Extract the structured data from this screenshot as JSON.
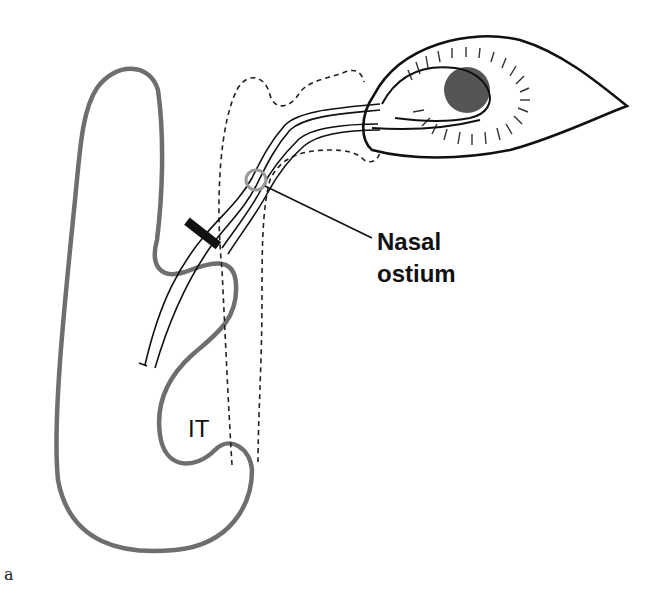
{
  "figure": {
    "panel_label": "a",
    "labels": {
      "nasal_ostium_line1": "Nasal",
      "nasal_ostium_line2": "ostium",
      "inferior_turbinate": "IT"
    }
  },
  "colors": {
    "nasal_wall": "#6e6e6e",
    "outline": "#111111",
    "pupil": "#555555",
    "ostium_ring": "#9a9a9a",
    "background": "#ffffff"
  }
}
